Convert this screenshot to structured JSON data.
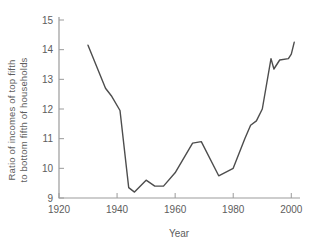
{
  "chart_data": {
    "type": "line",
    "title": "",
    "xlabel": "Year",
    "ylabel_line1": "Ratio of incomes of top fifth",
    "ylabel_line2": "to bottom fifth of households",
    "xlim": [
      1920,
      2003
    ],
    "ylim": [
      9,
      15
    ],
    "x_ticks": [
      1920,
      1940,
      1960,
      1980,
      2000
    ],
    "y_ticks": [
      9,
      10,
      11,
      12,
      13,
      14,
      15
    ],
    "grid": false,
    "legend": null,
    "series": [
      {
        "name": "income-ratio",
        "color": "#4d4d4d",
        "points": [
          [
            1930,
            14.15
          ],
          [
            1936,
            12.7
          ],
          [
            1938,
            12.45
          ],
          [
            1941,
            11.95
          ],
          [
            1944,
            9.35
          ],
          [
            1946,
            9.2
          ],
          [
            1950,
            9.6
          ],
          [
            1953,
            9.4
          ],
          [
            1956,
            9.4
          ],
          [
            1960,
            9.85
          ],
          [
            1966,
            10.85
          ],
          [
            1969,
            10.9
          ],
          [
            1975,
            9.75
          ],
          [
            1980,
            10.0
          ],
          [
            1984,
            11.0
          ],
          [
            1986,
            11.45
          ],
          [
            1988,
            11.6
          ],
          [
            1990,
            12.0
          ],
          [
            1993,
            13.7
          ],
          [
            1994,
            13.35
          ],
          [
            1996,
            13.65
          ],
          [
            1999,
            13.7
          ],
          [
            2000,
            13.85
          ],
          [
            2001,
            14.25
          ]
        ]
      }
    ],
    "colors": {
      "axis": "#9b9b9b",
      "text": "#5d5d5d",
      "background": "#ffffff"
    }
  }
}
